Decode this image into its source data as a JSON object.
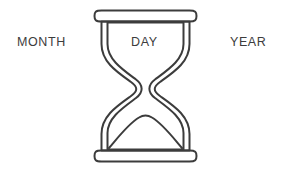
{
  "canvas": {
    "width": 284,
    "height": 172,
    "background_color": "#ffffff"
  },
  "illustration": {
    "name": "hourglass",
    "stroke_color": "#3c3c3c",
    "fill_color": "#ffffff",
    "stroke_width": 2,
    "description": "Line-art hourglass with rounded top cap, rounded bottom cap, S-curved waist and a mound of sand in the lower chamber",
    "parts": [
      "top-cap",
      "top-chamber",
      "neck",
      "bottom-chamber",
      "sand-mound",
      "bottom-cap"
    ]
  },
  "labels": {
    "month": "MONTH",
    "day": "DAY",
    "year": "YEAR"
  },
  "text_color": "#3c3c3c"
}
